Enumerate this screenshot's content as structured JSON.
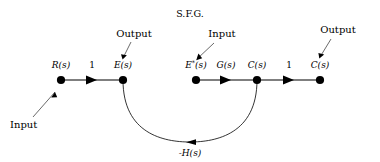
{
  "figure": {
    "title": "S.F.G.",
    "background_color": "#ffffff",
    "ink_color": "#000000",
    "width": 380,
    "height": 162
  },
  "nodes": [
    {
      "id": "Rs",
      "label": "R(s)",
      "superscript": "",
      "x": 61,
      "y": 80
    },
    {
      "id": "Es",
      "label": "E(s)",
      "superscript": "",
      "x": 123,
      "y": 80
    },
    {
      "id": "Estar",
      "label": "E",
      "superscript": "*",
      "suffix": "(s)",
      "x": 196,
      "y": 80
    },
    {
      "id": "Cs1",
      "label": "C(s)",
      "superscript": "",
      "x": 257,
      "y": 80
    },
    {
      "id": "Cs2",
      "label": "C(s)",
      "superscript": "",
      "x": 320,
      "y": 80
    }
  ],
  "branches": [
    {
      "from": "Rs",
      "to": "Es",
      "gain": "1",
      "gain_x": 92,
      "gain_y": 66
    },
    {
      "from": "Estar",
      "to": "Cs1",
      "gain": "G(s)",
      "gain_x": 226,
      "gain_y": 66
    },
    {
      "from": "Cs1",
      "to": "Cs2",
      "gain": "1",
      "gain_x": 289,
      "gain_y": 66
    }
  ],
  "feedback": {
    "from": "Cs1",
    "to": "Es",
    "gain": "-H(s)",
    "gain_x": 190,
    "gain_y": 152
  },
  "annotations": [
    {
      "id": "input-left",
      "label": "Input",
      "text_x": 10,
      "text_y": 125,
      "line_x1": 33,
      "line_y1": 117,
      "line_x2": 55,
      "line_y2": 92
    },
    {
      "id": "output-e",
      "label": "Output",
      "text_x": 110,
      "text_y": 37,
      "line_x1": 131,
      "line_y1": 42,
      "line_x2": 123,
      "line_y2": 60
    },
    {
      "id": "input-estar",
      "label": "Input",
      "text_x": 216,
      "text_y": 37,
      "line_x1": 215,
      "line_y1": 42,
      "line_x2": 198,
      "line_y2": 60
    },
    {
      "id": "output-c",
      "label": "Output",
      "text_x": 312,
      "text_y": 32,
      "line_x1": 330,
      "line_y1": 38,
      "line_x2": 320,
      "line_y2": 58
    }
  ]
}
